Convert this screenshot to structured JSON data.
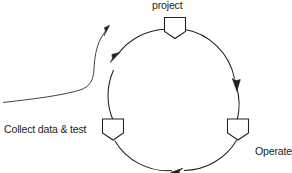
{
  "diagram": {
    "type": "cycle-diagram",
    "title": "",
    "background_color": "#ffffff",
    "stroke_color": "#231f20",
    "node_fill_color": "#ffffff",
    "labels": {
      "top": "project",
      "left": "Collect data & test",
      "right_line1": "Operate",
      "right_line2": "project"
    },
    "nodes": [
      {
        "id": "node-top",
        "label": "project",
        "label_position": "above",
        "cx": 175,
        "cy": 28
      },
      {
        "id": "node-left",
        "label": "Collect data & test",
        "label_position": "left",
        "cx": 113,
        "cy": 130
      },
      {
        "id": "node-right",
        "label": "Operate project",
        "label_position": "right",
        "cx": 238,
        "cy": 130
      }
    ],
    "cycle": {
      "center_x": 175,
      "center_y": 90,
      "radius": 62,
      "direction": "clockwise",
      "arrowheads": [
        {
          "id": "arrow-right-descending",
          "x": 236,
          "y": 83,
          "direction": "down"
        },
        {
          "id": "arrow-bottom",
          "x": 177,
          "y": 170,
          "direction": "left"
        },
        {
          "id": "arrow-left-ascending",
          "x": 115,
          "y": 58,
          "direction": "up"
        }
      ]
    },
    "entry_arrow": {
      "id": "entry-arrow",
      "description": "curved input arrow entering from the left edge",
      "start_x": 4,
      "start_y": 102,
      "tip_x": 108,
      "tip_y": 27
    }
  }
}
